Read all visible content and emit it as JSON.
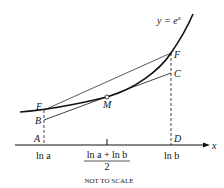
{
  "diagram": {
    "curve_label": "y = e",
    "curve_label_exp": "x",
    "axis_label": "x",
    "points": {
      "A": "A",
      "B": "B",
      "C": "C",
      "D": "D",
      "E": "E",
      "F": "F",
      "M": "M"
    },
    "ticks": {
      "left": "ln a",
      "mid_numerator": "ln a + ln b",
      "mid_denominator": "2",
      "right": "ln b"
    },
    "footnote": "NOT TO SCALE",
    "colors": {
      "ink": "#111111",
      "background": "#ffffff"
    }
  }
}
